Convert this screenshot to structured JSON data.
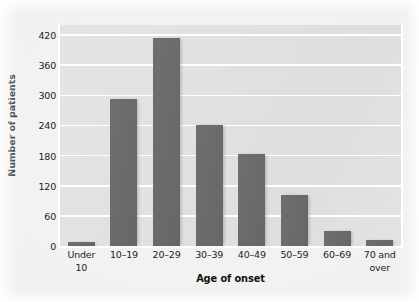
{
  "chart_data": {
    "type": "bar",
    "title": "",
    "xlabel": "Age of onset",
    "ylabel": "Number of patients",
    "categories": [
      "Under 10",
      "10–19",
      "20–29",
      "30–39",
      "40–49",
      "50–59",
      "60–69",
      "70 and over"
    ],
    "category_lines": [
      [
        "Under",
        "10"
      ],
      [
        "10–19"
      ],
      [
        "20–29"
      ],
      [
        "30–39"
      ],
      [
        "40–49"
      ],
      [
        "50–59"
      ],
      [
        "60–69"
      ],
      [
        "70 and",
        "over"
      ]
    ],
    "values": [
      8,
      292,
      415,
      240,
      184,
      102,
      30,
      12
    ],
    "ylim": [
      0,
      440
    ],
    "yticks": [
      0,
      60,
      120,
      180,
      240,
      300,
      360,
      420
    ],
    "ytick_labels": [
      "0",
      "60",
      "120",
      "180",
      "240",
      "300",
      "360",
      "420"
    ],
    "grid": true,
    "grid_axis": "y",
    "legend": null,
    "colors": {
      "bar": "#6b6b6b",
      "plot_background": "#e1e1e1",
      "gridline": "#ffffff",
      "figure_background": "#f2f2f2",
      "text": "#1c1c1c"
    }
  }
}
